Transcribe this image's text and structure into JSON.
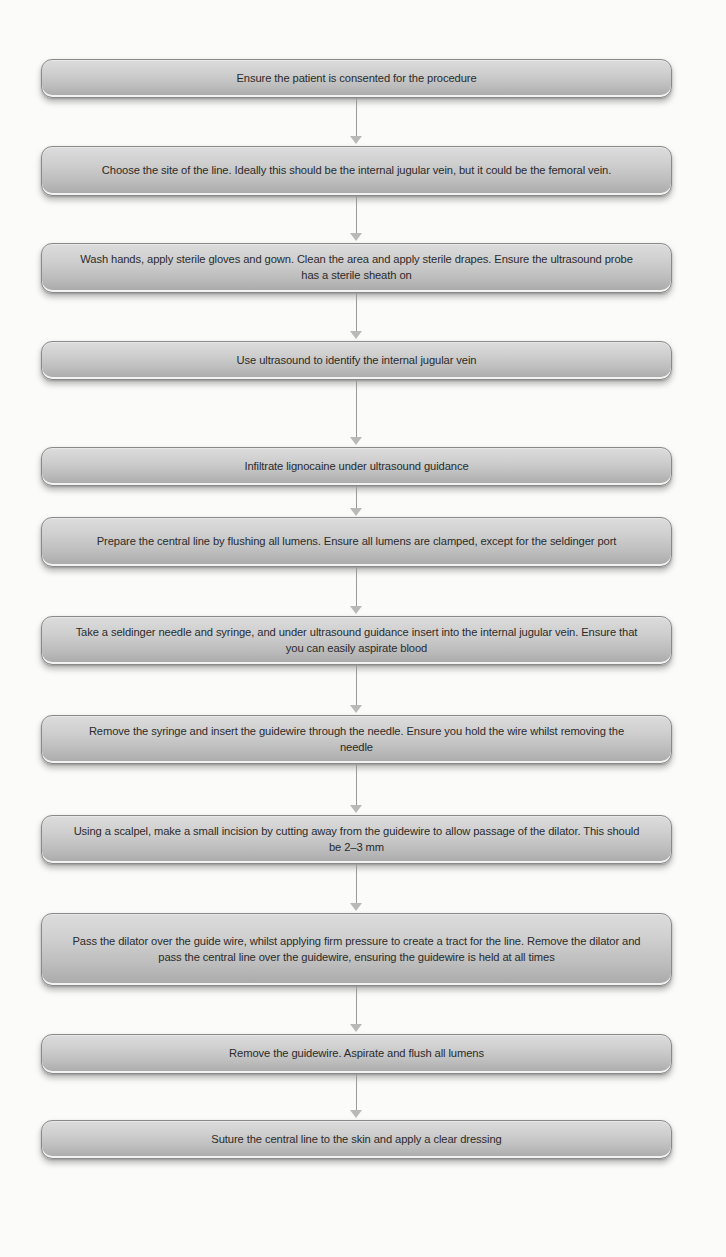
{
  "diagram": {
    "type": "flowchart",
    "direction": "top-to-bottom",
    "colors": {
      "background": "#fbfbfa",
      "box_fill_top": "#dcdcdc",
      "box_fill_bottom": "#a9a9a9",
      "box_border": "#8a8a8a",
      "text": "#2b2b2b",
      "arrow": "#9a9a9a"
    },
    "steps": [
      {
        "text": "Ensure the patient is consented for the procedure"
      },
      {
        "text": "Choose the site of the line. Ideally this should be the internal jugular vein, but it could be the femoral vein."
      },
      {
        "text": "Wash hands, apply sterile gloves and gown. Clean the area and apply sterile drapes. Ensure the ultrasound probe has a sterile sheath on"
      },
      {
        "text": "Use ultrasound to identify the internal jugular vein"
      },
      {
        "text": "Infiltrate lignocaine under ultrasound guidance"
      },
      {
        "text": "Prepare the central line by flushing all lumens. Ensure all lumens are clamped, except for the seldinger port"
      },
      {
        "text": "Take a seldinger needle and syringe, and under ultrasound guidance insert into the internal jugular vein. Ensure that you can easily aspirate blood"
      },
      {
        "text": "Remove the syringe and insert the guidewire through the needle. Ensure you hold the wire whilst removing the needle"
      },
      {
        "text": "Using a scalpel, make a small incision by cutting away from the guidewire to allow passage of the dilator. This should be 2–3 mm"
      },
      {
        "text": "Pass the dilator over the guide wire, whilst applying firm pressure to create a tract for the line. Remove the dilator and pass the central line over the guidewire, ensuring the guidewire is held at all times"
      },
      {
        "text": "Remove the guidewire. Aspirate and flush all lumens"
      },
      {
        "text": "Suture the central line to the skin and apply a clear dressing"
      }
    ],
    "connectors": [
      {
        "from": 1,
        "to": 2,
        "icon": "arrow-down-icon"
      },
      {
        "from": 2,
        "to": 3,
        "icon": "arrow-down-icon"
      },
      {
        "from": 3,
        "to": 4,
        "icon": "arrow-down-icon"
      },
      {
        "from": 4,
        "to": 5,
        "icon": "arrow-down-icon"
      },
      {
        "from": 5,
        "to": 6,
        "icon": "arrow-down-icon"
      },
      {
        "from": 6,
        "to": 7,
        "icon": "arrow-down-icon"
      },
      {
        "from": 7,
        "to": 8,
        "icon": "arrow-down-icon"
      },
      {
        "from": 8,
        "to": 9,
        "icon": "arrow-down-icon"
      },
      {
        "from": 9,
        "to": 10,
        "icon": "arrow-down-icon"
      },
      {
        "from": 10,
        "to": 11,
        "icon": "arrow-down-icon"
      },
      {
        "from": 11,
        "to": 12,
        "icon": "arrow-down-icon"
      }
    ]
  }
}
